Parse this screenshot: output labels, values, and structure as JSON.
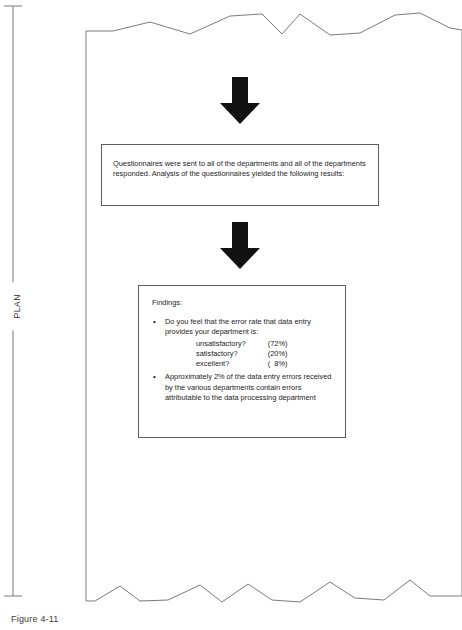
{
  "figure": {
    "caption": "Figure 4-11",
    "side_label": "PLAN"
  },
  "flow": {
    "arrow_top": "down-arrow",
    "arrow_middle": "down-arrow",
    "boxes": [
      {
        "id": "questionnaire-results",
        "text": "Questionnaires were sent to all of the departments and all of the departments responded. Analysis of the questionnaires yielded the following results:"
      },
      {
        "id": "findings",
        "title": "Findings:",
        "bullets": [
          {
            "text": "Do you feel that the error rate that data entry provides your department is:",
            "options": [
              {
                "label": "unsatisfactory?",
                "value": "(72%)"
              },
              {
                "label": "satisfactory?",
                "value": "(20%)"
              },
              {
                "label": "excellent?",
                "value": "(  8%)"
              }
            ]
          },
          {
            "text": "Approximately 2% of the data entry errors received by the various departments contain errors attributable to the data processing department",
            "options": []
          }
        ]
      }
    ]
  },
  "colors": {
    "ink": "#1c1c1c",
    "box_border": "#5c5c5c",
    "paper_edge": "#6b6b6b",
    "arrow_fill": "#111111"
  }
}
